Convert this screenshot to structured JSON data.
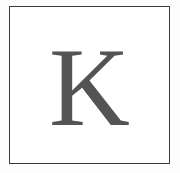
{
  "card": {
    "letter": "K",
    "letter_color": "#545454",
    "border_color": "#3a3a3a",
    "background": "#ffffff"
  }
}
